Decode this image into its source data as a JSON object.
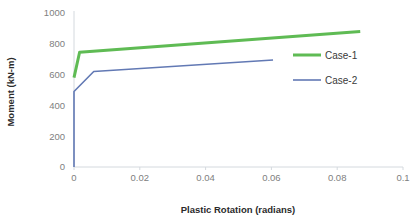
{
  "chart_data": {
    "type": "line",
    "title": "",
    "xlabel": "Plastic Rotation (radians)",
    "ylabel": "Moment (kN-m)",
    "xlim": [
      0,
      0.1
    ],
    "ylim": [
      0,
      1000
    ],
    "xticks": [
      "0",
      "0.02",
      "0.04",
      "0.06",
      "0.08",
      "0.1"
    ],
    "xtick_values": [
      0,
      0.02,
      0.04,
      0.06,
      0.08,
      0.1
    ],
    "yticks": [
      "0",
      "200",
      "400",
      "600",
      "800",
      "1000"
    ],
    "ytick_values": [
      0,
      200,
      400,
      600,
      800,
      1000
    ],
    "grid": false,
    "legend_position": "right",
    "series": [
      {
        "name": "Case-1",
        "color": "#5FBB54",
        "width": 3,
        "x": [
          0,
          0.0017,
          0.087
        ],
        "y": [
          580,
          745,
          880
        ]
      },
      {
        "name": "Case-2",
        "color": "#6279B4",
        "width": 1.6,
        "x": [
          0,
          0,
          0.006,
          0.0605
        ],
        "y": [
          0,
          490,
          620,
          695
        ]
      }
    ]
  },
  "legend": {
    "items": [
      {
        "label": "Case-1",
        "color": "#5FBB54",
        "width": 3
      },
      {
        "label": "Case-2",
        "color": "#6279B4",
        "width": 1.6
      }
    ]
  },
  "axes": {
    "x_title": "Plastic Rotation (radians)",
    "y_title": "Moment (kN-m)"
  }
}
